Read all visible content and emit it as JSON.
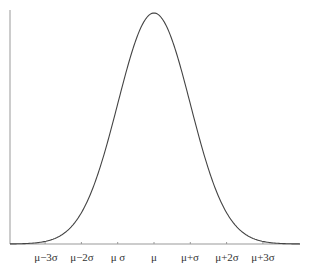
{
  "chart_data": {
    "type": "line",
    "title": "",
    "subtitle": "",
    "xlabel": "",
    "ylabel": "",
    "x_tick_labels": [
      "μ−3σ",
      "μ−2σ",
      "μ σ",
      "μ",
      "μ+σ",
      "μ+2σ",
      "μ+3σ"
    ],
    "x_tick_values": [
      -3,
      -2,
      -1,
      0,
      1,
      2,
      3
    ],
    "xlim": [
      -4.0,
      4.0
    ],
    "ylim": [
      0,
      0.4
    ],
    "grid": false,
    "legend": null,
    "series": [
      {
        "name": "normal density",
        "x": [
          -4.0,
          -3.5,
          -3.0,
          -2.5,
          -2.0,
          -1.5,
          -1.0,
          -0.5,
          0.0,
          0.5,
          1.0,
          1.5,
          2.0,
          2.5,
          3.0,
          3.5,
          4.0
        ],
        "y": [
          0.0001,
          0.0009,
          0.0044,
          0.0175,
          0.054,
          0.1295,
          0.242,
          0.3521,
          0.3989,
          0.3521,
          0.242,
          0.1295,
          0.054,
          0.0175,
          0.0044,
          0.0009,
          0.0001
        ]
      }
    ],
    "colors": {
      "curve": "#444444",
      "axis": "#999999",
      "text": "#333333"
    }
  }
}
